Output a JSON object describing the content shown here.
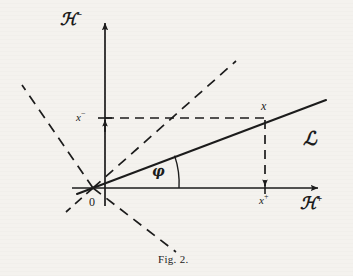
{
  "figure": {
    "caption": "Fig. 2.",
    "background_color": "#f4f2ee",
    "ink_color": "#1b1b1b"
  },
  "axes": {
    "vertical": {
      "label_base": "ℋ",
      "label_sup": "−",
      "label_full": "ℋ⁻",
      "direction": "up"
    },
    "horizontal": {
      "label_base": "ℋ",
      "label_sup": "+",
      "label_full": "ℋ⁺",
      "direction": "right"
    },
    "origin_label": "0"
  },
  "annotations": {
    "line_label": "ℒ",
    "angle_label": "φ",
    "point_label": "x",
    "coord_plus_base": "x",
    "coord_plus_sup": "+",
    "coord_plus_full": "x⁺",
    "coord_minus_base": "x",
    "coord_minus_sup": "−",
    "coord_minus_full": "x⁻"
  },
  "geometry": {
    "origin": {
      "x": 93,
      "y": 188
    },
    "vertical_axis_x": 105,
    "vertical_axis_top_y": 20,
    "horizontal_axis_y": 188,
    "horizontal_axis_right_x": 322,
    "line_L": {
      "x1": 77,
      "y1": 194,
      "x2": 326,
      "y2": 100
    },
    "point_x": {
      "x": 265,
      "y": 118
    },
    "coord_plus_tick": {
      "x": 265,
      "y": 188
    },
    "coord_minus_tick": {
      "x": 105,
      "y": 118
    },
    "dashed_diagonal_up_right": {
      "x1": 93,
      "y1": 188,
      "x2": 236,
      "y2": 61
    },
    "dashed_diagonal_up_left": {
      "x1": 93,
      "y1": 188,
      "x2": 22,
      "y2": 85
    },
    "dashed_diagonal_down_right": {
      "x1": 93,
      "y1": 188,
      "x2": 176,
      "y2": 252
    },
    "dashed_diagonal_down_left": {
      "x1": 93,
      "y1": 188,
      "x2": 66,
      "y2": 212
    },
    "angle_arc_radius": 86
  }
}
